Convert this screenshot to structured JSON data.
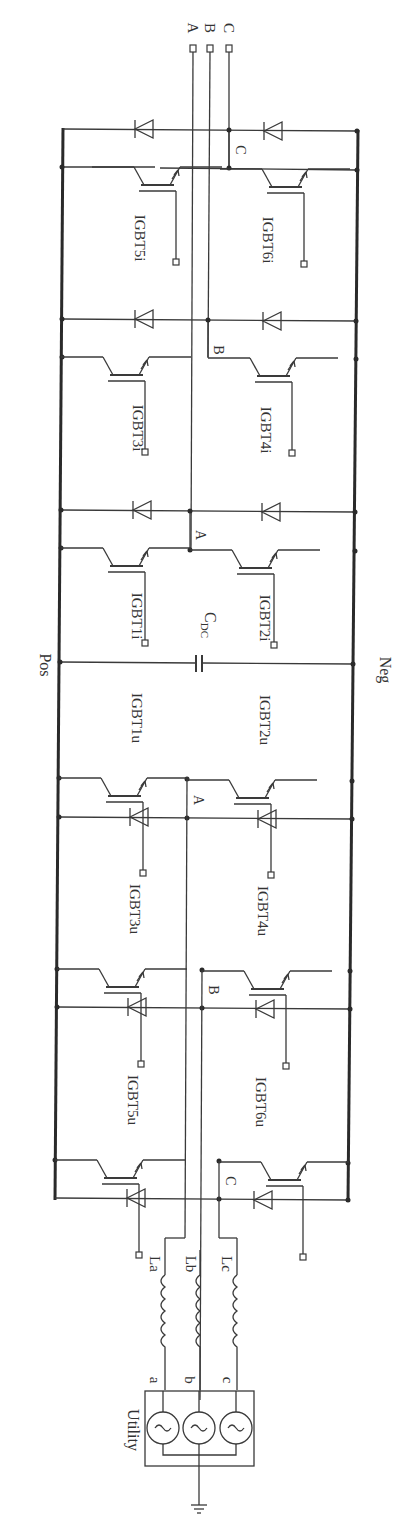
{
  "diagram": {
    "rails": {
      "positive": "Pos",
      "negative": "Neg"
    },
    "capacitor": {
      "label": "C",
      "subscript": "DC"
    },
    "output_terminals": [
      "A",
      "B",
      "C"
    ],
    "inverter": {
      "legs": [
        {
          "phase": "C",
          "upper": "IGBT5i",
          "lower": "IGBT6i"
        },
        {
          "phase": "B",
          "upper": "IGBT3i",
          "lower": "IGBT4i"
        },
        {
          "phase": "A",
          "upper": "IGBT1i",
          "lower": "IGBT2i"
        }
      ]
    },
    "rectifier": {
      "legs": [
        {
          "phase": "A",
          "upper": "IGBT1u",
          "lower": "IGBT2u"
        },
        {
          "phase": "B",
          "upper": "IGBT3u",
          "lower": "IGBT4u"
        },
        {
          "phase": "C",
          "upper": "IGBT5u",
          "lower": "IGBT6u"
        }
      ]
    },
    "inductors": [
      "La",
      "Lb",
      "Lc"
    ],
    "utility": {
      "label": "Utility",
      "phases": [
        "a",
        "b",
        "c"
      ]
    }
  }
}
